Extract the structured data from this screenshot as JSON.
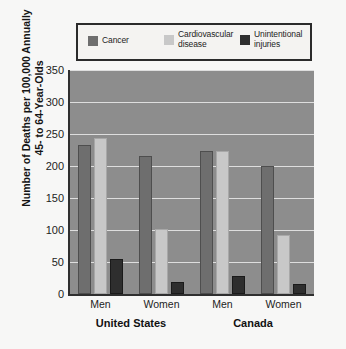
{
  "figure": {
    "background_color": "#f7f7f6",
    "plot_background_color": "#8d8d8d"
  },
  "legend": {
    "entries": [
      {
        "label": "Cancer",
        "color": "#6e6e6e",
        "swatch_name": "legend-swatch-cancer"
      },
      {
        "label": "Cardiovascular\ndisease",
        "color": "#c8c8c8",
        "swatch_name": "legend-swatch-cardiovascular-disease"
      },
      {
        "label": "Unintentional\ninjuries",
        "color": "#2e2e2e",
        "swatch_name": "legend-swatch-unintentional-injuries"
      }
    ]
  },
  "axes": {
    "y_title": "Number of Deaths per 100,000 Annually\n45- to 64-Year-Olds",
    "y_ticks": [
      "350",
      "300",
      "250",
      "200",
      "150",
      "100",
      "50",
      "0"
    ],
    "y_min": 0,
    "y_max": 350,
    "x_ticks": [
      "Men",
      "Women",
      "Men",
      "Women"
    ],
    "x_groups": [
      "United States",
      "Canada"
    ]
  },
  "chart_data": {
    "type": "bar",
    "title": "",
    "xlabel": "",
    "ylabel": "Number of Deaths per 100,000 Annually 45- to 64-Year-Olds",
    "ylim": [
      0,
      350
    ],
    "ytick_step": 50,
    "grid": true,
    "legend_position": "top",
    "categories": [
      "United States - Men",
      "United States - Women",
      "Canada - Men",
      "Canada - Women"
    ],
    "groups": [
      {
        "region": "United States",
        "subgroups": [
          "Men",
          "Women"
        ]
      },
      {
        "region": "Canada",
        "subgroups": [
          "Men",
          "Women"
        ]
      }
    ],
    "series": [
      {
        "name": "Cancer",
        "color": "#6e6e6e",
        "values": [
          233,
          215,
          224,
          200
        ]
      },
      {
        "name": "Cardiovascular disease",
        "color": "#c8c8c8",
        "values": [
          243,
          101,
          224,
          92
        ]
      },
      {
        "name": "Unintentional injuries",
        "color": "#2e2e2e",
        "values": [
          55,
          18,
          28,
          15
        ]
      }
    ]
  }
}
